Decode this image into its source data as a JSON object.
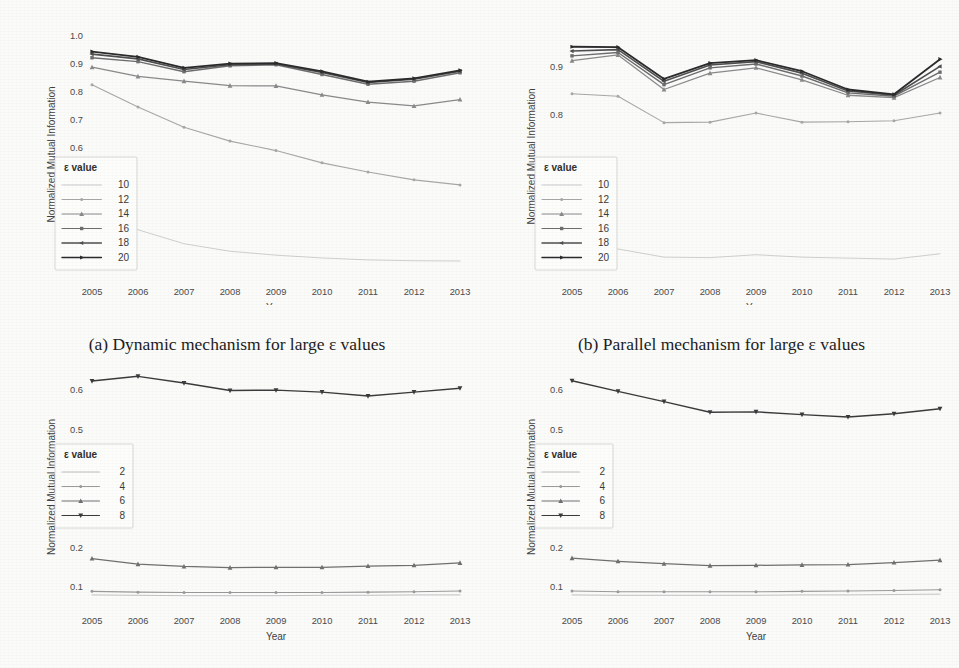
{
  "page": {
    "background_color": "#fbfbfa",
    "text_color": "#3a3a3a"
  },
  "captions": {
    "a": "(a) Dynamic mechanism for large ε values",
    "b": "(b) Parallel mechanism for large ε values"
  },
  "common": {
    "xlabel": "Year",
    "ylabel": "Normalized Mutual Information",
    "legend_title": "ε value",
    "years": [
      "2005",
      "2006",
      "2007",
      "2008",
      "2009",
      "2010",
      "2011",
      "2012",
      "2013"
    ]
  },
  "chart_data": [
    {
      "id": "a",
      "type": "line",
      "title": "(a) Dynamic mechanism for large ε values",
      "xlabel": "Year",
      "ylabel": "Normalized Mutual Information",
      "legend_title": "ε value",
      "legend_position": "center-left",
      "grid": false,
      "x": [
        2005,
        2006,
        2007,
        2008,
        2009,
        2010,
        2011,
        2012,
        2013
      ],
      "xtick_labels": [
        "2005",
        "2006",
        "2007",
        "2008",
        "2009",
        "2010",
        "2011",
        "2012",
        "2013"
      ],
      "ytick_labels": [
        "0.2",
        "0.3",
        "0.4",
        "0.5",
        "0.6",
        "0.7",
        "0.8",
        "0.9",
        "1.0"
      ],
      "ylim": [
        0.15,
        1.0
      ],
      "yticks": [
        0.2,
        0.3,
        0.4,
        0.5,
        0.6,
        0.7,
        0.8,
        0.9,
        1.0
      ],
      "series": [
        {
          "name": "10",
          "color": "#c9c9c9",
          "marker": "none",
          "values": [
            0.4,
            0.305,
            0.255,
            0.228,
            0.214,
            0.204,
            0.197,
            0.194,
            0.193
          ]
        },
        {
          "name": "12",
          "color": "#a8a8a8",
          "marker": "dot",
          "values": [
            0.825,
            0.745,
            0.673,
            0.623,
            0.589,
            0.545,
            0.512,
            0.484,
            0.466
          ]
        },
        {
          "name": "14",
          "color": "#8a8a8a",
          "marker": "triangle",
          "values": [
            0.888,
            0.855,
            0.838,
            0.822,
            0.821,
            0.789,
            0.763,
            0.749,
            0.772
          ]
        },
        {
          "name": "16",
          "color": "#6e6e6e",
          "marker": "square",
          "values": [
            0.922,
            0.908,
            0.872,
            0.893,
            0.897,
            0.862,
            0.827,
            0.838,
            0.868
          ]
        },
        {
          "name": "18",
          "color": "#4f4f4f",
          "marker": "left-arrow",
          "values": [
            0.935,
            0.918,
            0.88,
            0.897,
            0.9,
            0.869,
            0.833,
            0.845,
            0.874
          ]
        },
        {
          "name": "20",
          "color": "#2b2b2b",
          "marker": "right-arrow",
          "values": [
            0.944,
            0.925,
            0.886,
            0.901,
            0.903,
            0.873,
            0.836,
            0.848,
            0.877
          ]
        }
      ]
    },
    {
      "id": "b",
      "type": "line",
      "title": "(b) Parallel mechanism for large ε values",
      "xlabel": "Year",
      "ylabel": "Normalized Mutual Information",
      "legend_title": "ε value",
      "legend_position": "center-left",
      "grid": false,
      "x": [
        2005,
        2006,
        2007,
        2008,
        2009,
        2010,
        2011,
        2012,
        2013
      ],
      "xtick_labels": [
        "2005",
        "2006",
        "2007",
        "2008",
        "2009",
        "2010",
        "2011",
        "2012",
        "2013"
      ],
      "ytick_labels": [
        "0.5",
        "0.6",
        "0.7",
        "0.8",
        "0.9"
      ],
      "ylim": [
        0.47,
        0.955
      ],
      "yticks": [
        0.5,
        0.6,
        0.7,
        0.8,
        0.9
      ],
      "series": [
        {
          "name": "10",
          "color": "#c9c9c9",
          "marker": "none",
          "values": [
            0.538,
            0.52,
            0.503,
            0.502,
            0.508,
            0.503,
            0.501,
            0.499,
            0.51
          ]
        },
        {
          "name": "12",
          "color": "#a8a8a8",
          "marker": "dot",
          "values": [
            0.843,
            0.838,
            0.783,
            0.784,
            0.803,
            0.784,
            0.785,
            0.787,
            0.803
          ]
        },
        {
          "name": "14",
          "color": "#8a8a8a",
          "marker": "triangle",
          "values": [
            0.912,
            0.924,
            0.852,
            0.886,
            0.897,
            0.872,
            0.84,
            0.835,
            0.877
          ]
        },
        {
          "name": "16",
          "color": "#6e6e6e",
          "marker": "square",
          "values": [
            0.922,
            0.929,
            0.862,
            0.897,
            0.905,
            0.88,
            0.845,
            0.838,
            0.888
          ]
        },
        {
          "name": "18",
          "color": "#4f4f4f",
          "marker": "left-arrow",
          "values": [
            0.932,
            0.935,
            0.869,
            0.903,
            0.91,
            0.886,
            0.849,
            0.84,
            0.9
          ]
        },
        {
          "name": "20",
          "color": "#2b2b2b",
          "marker": "right-arrow",
          "values": [
            0.941,
            0.94,
            0.874,
            0.907,
            0.913,
            0.89,
            0.852,
            0.842,
            0.915
          ]
        }
      ]
    },
    {
      "id": "c",
      "type": "line",
      "title": "",
      "xlabel": "Year",
      "ylabel": "Normalized Mutual Information",
      "legend_title": "ε value",
      "legend_position": "center-left",
      "grid": false,
      "x": [
        2005,
        2006,
        2007,
        2008,
        2009,
        2010,
        2011,
        2012,
        2013
      ],
      "xtick_labels": [
        "2005",
        "2006",
        "2007",
        "2008",
        "2009",
        "2010",
        "2011",
        "2012",
        "2013"
      ],
      "ytick_labels": [
        "0.1",
        "0.2",
        "0.3",
        "0.4",
        "0.5",
        "0.6"
      ],
      "ylim": [
        0.062,
        0.645
      ],
      "yticks": [
        0.1,
        0.2,
        0.3,
        0.4,
        0.5,
        0.6
      ],
      "series": [
        {
          "name": "2",
          "color": "#bdbdbd",
          "marker": "none",
          "values": [
            0.08,
            0.079,
            0.078,
            0.078,
            0.078,
            0.079,
            0.079,
            0.08,
            0.08
          ]
        },
        {
          "name": "4",
          "color": "#9a9a9a",
          "marker": "dot",
          "values": [
            0.089,
            0.087,
            0.086,
            0.086,
            0.086,
            0.086,
            0.087,
            0.088,
            0.09
          ]
        },
        {
          "name": "6",
          "color": "#707070",
          "marker": "triangle",
          "values": [
            0.172,
            0.158,
            0.152,
            0.149,
            0.15,
            0.15,
            0.153,
            0.155,
            0.161
          ]
        },
        {
          "name": "8",
          "color": "#3b3b3b",
          "marker": "down-triangle",
          "values": [
            0.622,
            0.634,
            0.617,
            0.598,
            0.599,
            0.594,
            0.584,
            0.594,
            0.604
          ]
        }
      ]
    },
    {
      "id": "d",
      "type": "line",
      "title": "",
      "xlabel": "Year",
      "ylabel": "Normalized Mutual Information",
      "legend_title": "ε value",
      "legend_position": "center-left",
      "grid": false,
      "x": [
        2005,
        2006,
        2007,
        2008,
        2009,
        2010,
        2011,
        2012,
        2013
      ],
      "xtick_labels": [
        "2005",
        "2006",
        "2007",
        "2008",
        "2009",
        "2010",
        "2011",
        "2012",
        "2013"
      ],
      "ytick_labels": [
        "0.1",
        "0.2",
        "0.3",
        "0.4",
        "0.5",
        "0.6"
      ],
      "ylim": [
        0.062,
        0.645
      ],
      "yticks": [
        0.1,
        0.2,
        0.3,
        0.4,
        0.5,
        0.6
      ],
      "series": [
        {
          "name": "2",
          "color": "#bdbdbd",
          "marker": "none",
          "values": [
            0.08,
            0.079,
            0.079,
            0.079,
            0.079,
            0.08,
            0.08,
            0.081,
            0.082
          ]
        },
        {
          "name": "4",
          "color": "#9a9a9a",
          "marker": "dot",
          "values": [
            0.09,
            0.088,
            0.088,
            0.088,
            0.088,
            0.089,
            0.09,
            0.091,
            0.093
          ]
        },
        {
          "name": "6",
          "color": "#707070",
          "marker": "triangle",
          "values": [
            0.173,
            0.165,
            0.159,
            0.154,
            0.155,
            0.156,
            0.157,
            0.162,
            0.168
          ]
        },
        {
          "name": "8",
          "color": "#3b3b3b",
          "marker": "down-triangle",
          "values": [
            0.623,
            0.596,
            0.57,
            0.543,
            0.544,
            0.537,
            0.531,
            0.539,
            0.552
          ]
        }
      ]
    }
  ]
}
